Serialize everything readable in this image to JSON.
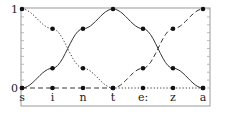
{
  "chart_data": {
    "type": "line",
    "title": "",
    "xlabel": "",
    "ylabel": "",
    "categories": [
      "s",
      "i",
      "n",
      "t",
      "e:",
      "z",
      "a"
    ],
    "ylim": [
      0,
      1
    ],
    "yticks": [
      "0",
      "1"
    ],
    "grid": false,
    "legend": null,
    "series": [
      {
        "name": "dotted",
        "style": "dotted",
        "values": [
          1,
          0.75,
          0.25,
          0,
          0,
          0,
          0
        ]
      },
      {
        "name": "solid",
        "style": "solid",
        "values": [
          0,
          0.25,
          0.75,
          1,
          0.75,
          0.25,
          0
        ]
      },
      {
        "name": "dashed",
        "style": "dashed",
        "values": [
          0,
          0,
          0,
          0,
          0.25,
          0.75,
          1
        ]
      }
    ]
  },
  "colors": {
    "line": "#333333",
    "frame": "#888888",
    "point": "#111111"
  }
}
